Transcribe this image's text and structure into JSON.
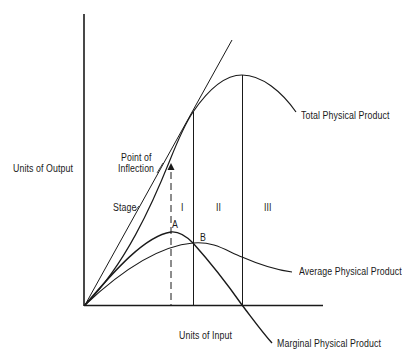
{
  "diagram": {
    "axes": {
      "y_label": "Units of Output",
      "x_label": "Units of Input"
    },
    "curves": {
      "total": "Total Physical Product",
      "average": "Average Physical Product",
      "marginal": "Marginal Physical Product"
    },
    "annotations": {
      "inflection_line1": "Point of",
      "inflection_line2": "Inflection",
      "stage": "Stage",
      "stage_1": "I",
      "stage_2": "II",
      "stage_3": "III",
      "point_a": "A",
      "point_b": "B"
    },
    "colors": {
      "line": "#1a1a1a",
      "background": "#ffffff"
    }
  }
}
